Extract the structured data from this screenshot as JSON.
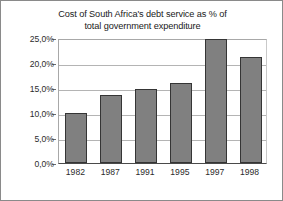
{
  "chart_data": {
    "type": "bar",
    "title": "Cost of South Africa's debt service as % of total government expenditure",
    "title_lines": [
      "Cost of South Africa's debt service as % of",
      "total government expenditure"
    ],
    "categories": [
      "1982",
      "1987",
      "1991",
      "1995",
      "1997",
      "1998"
    ],
    "values": [
      10.0,
      13.7,
      14.8,
      16.0,
      24.8,
      21.3
    ],
    "series": [
      {
        "name": "Debt service as % of total government expenditure",
        "values": [
          10.0,
          13.7,
          14.8,
          16.0,
          24.8,
          21.3
        ]
      }
    ],
    "xlabel": "",
    "ylabel": "",
    "ylim": [
      0.0,
      25.0
    ],
    "yticks": [
      0.0,
      5.0,
      10.0,
      15.0,
      20.0,
      25.0
    ],
    "ytick_labels": [
      "0,0%",
      "5,0%",
      "10,0%",
      "15,0%",
      "20,0%",
      "25,0%"
    ],
    "xtick_labels": [
      "1982",
      "1987",
      "1991",
      "1995",
      "1997",
      "1998"
    ],
    "grid": true,
    "grid_axis": "y",
    "legend": false,
    "legend_position": "none",
    "bar_color": "#808080",
    "bar_edge_color": "#353535",
    "gridline_color": "#b4b4b4",
    "axis_color": "#4a4a4a",
    "text_color": "#2b2b2b",
    "background_color": "#ffffff",
    "frame_color": "#8a8a8a",
    "decimal_separator": ","
  }
}
